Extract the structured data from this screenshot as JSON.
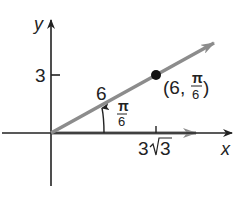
{
  "diagram": {
    "axes": {
      "x_label": "x",
      "y_label": "y"
    },
    "ticks": {
      "y_tick_label": "3",
      "x_tick_label_coef": "3",
      "x_tick_label_radicand": "3"
    },
    "ray": {
      "length_label": "6",
      "angle_label_num": "π",
      "angle_label_den": "6",
      "color": "#8c8c8c"
    },
    "point": {
      "label_open": "(6,",
      "label_num": "π",
      "label_den": "6",
      "label_close": ")",
      "color": "#111111"
    }
  }
}
